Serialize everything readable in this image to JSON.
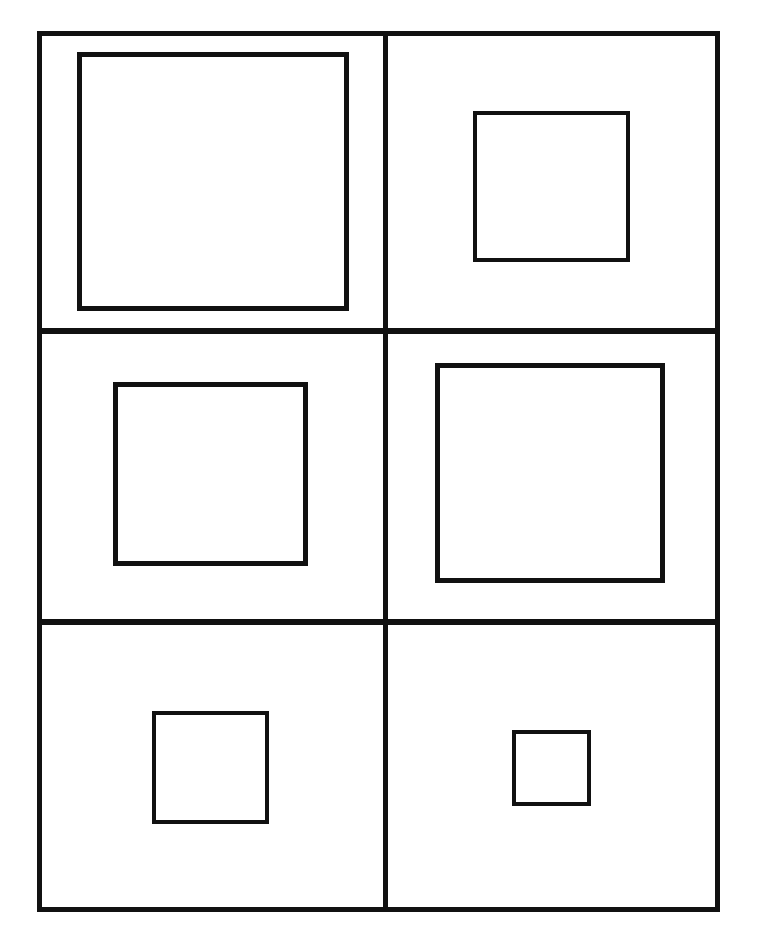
{
  "figure": {
    "background_color": "#ffffff",
    "line_color": "#111111",
    "canvas": {
      "width": 761,
      "height": 948
    }
  },
  "frame": {
    "name": "outer-frame",
    "x": 37,
    "y": 31,
    "width": 683,
    "height": 881,
    "stroke_width": 5,
    "stroke_color": "#111111"
  },
  "grid": {
    "rows": 3,
    "columns": 2,
    "vertical_dividers": [
      {
        "name": "center-vertical-divider",
        "x": 341,
        "width": 5,
        "y": 0,
        "height": 871
      }
    ],
    "horizontal_dividers": [
      {
        "name": "upper-horizontal-divider",
        "y": 292,
        "height": 6,
        "x": 0,
        "width": 673
      },
      {
        "name": "lower-horizontal-divider",
        "y": 583,
        "height": 6,
        "x": 0,
        "width": 673
      }
    ],
    "cells": [
      {
        "index": 1,
        "name": "cell-top-left",
        "row": 1,
        "column": 1,
        "x": 0,
        "y": 0,
        "width": 341,
        "height": 292
      },
      {
        "index": 2,
        "name": "cell-top-right",
        "row": 1,
        "column": 2,
        "x": 346,
        "y": 0,
        "width": 327,
        "height": 292
      },
      {
        "index": 3,
        "name": "cell-middle-left",
        "row": 2,
        "column": 1,
        "x": 0,
        "y": 298,
        "width": 341,
        "height": 285
      },
      {
        "index": 4,
        "name": "cell-middle-right",
        "row": 2,
        "column": 2,
        "x": 346,
        "y": 298,
        "width": 327,
        "height": 285
      },
      {
        "index": 5,
        "name": "cell-bottom-left",
        "row": 3,
        "column": 1,
        "x": 0,
        "y": 589,
        "width": 341,
        "height": 282
      },
      {
        "index": 6,
        "name": "cell-bottom-right",
        "row": 3,
        "column": 2,
        "x": 346,
        "y": 589,
        "width": 327,
        "height": 282
      }
    ]
  },
  "squares": [
    {
      "index": 1,
      "name": "square-top-left",
      "cell": "cell-top-left",
      "size_rank": "largest",
      "x": 77,
      "y": 52,
      "width": 272,
      "height": 259,
      "stroke_width": 5,
      "stroke_color": "#111111",
      "fill": "none"
    },
    {
      "index": 2,
      "name": "square-top-right",
      "cell": "cell-top-right",
      "size_rank": "small-medium",
      "x": 473,
      "y": 111,
      "width": 157,
      "height": 151,
      "stroke_width": 4,
      "stroke_color": "#111111",
      "fill": "none"
    },
    {
      "index": 3,
      "name": "square-middle-left",
      "cell": "cell-middle-left",
      "size_rank": "medium",
      "x": 113,
      "y": 382,
      "width": 195,
      "height": 184,
      "stroke_width": 5,
      "stroke_color": "#111111",
      "fill": "none"
    },
    {
      "index": 4,
      "name": "square-middle-right",
      "cell": "cell-middle-right",
      "size_rank": "large",
      "x": 435,
      "y": 363,
      "width": 230,
      "height": 220,
      "stroke_width": 5,
      "stroke_color": "#111111",
      "fill": "none"
    },
    {
      "index": 5,
      "name": "square-bottom-left",
      "cell": "cell-bottom-left",
      "size_rank": "small",
      "x": 152,
      "y": 711,
      "width": 117,
      "height": 113,
      "stroke_width": 4,
      "stroke_color": "#111111",
      "fill": "none"
    },
    {
      "index": 6,
      "name": "square-bottom-right",
      "cell": "cell-bottom-right",
      "size_rank": "smallest",
      "x": 512,
      "y": 730,
      "width": 79,
      "height": 76,
      "stroke_width": 4,
      "stroke_color": "#111111",
      "fill": "none"
    }
  ]
}
